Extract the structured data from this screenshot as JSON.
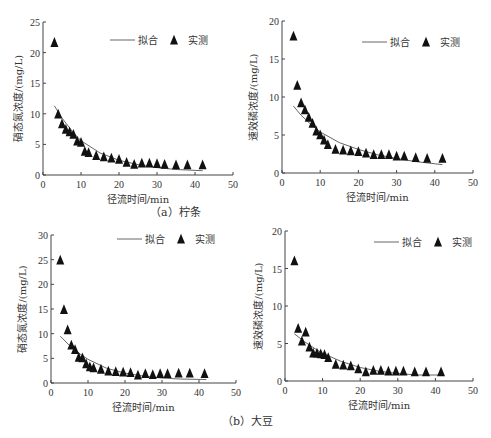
{
  "captions": {
    "a": "（a）柠条",
    "b": "（b）大豆"
  },
  "legend": {
    "fit": "拟合",
    "measured": "实测"
  },
  "colors": {
    "axis": "#444444",
    "marker": "#111111",
    "fit_line": "#555555"
  },
  "chart_data": [
    {
      "id": "a-left",
      "type": "scatter",
      "panel": "(a) 柠条",
      "title": "",
      "xlabel": "径流时间/min",
      "ylabel": "硝态氮浓度/(mg/L)",
      "xlim": [
        0,
        50
      ],
      "ylim": [
        0,
        25
      ],
      "xticks": [
        0,
        10,
        20,
        30,
        40,
        50
      ],
      "yticks": [
        0,
        5,
        10,
        15,
        20,
        25
      ],
      "legend_position": "top-right",
      "grid": false,
      "series": [
        {
          "name": "实测",
          "style": "triangle-marker",
          "x": [
            3,
            4,
            5,
            6,
            7,
            8,
            9,
            10,
            11,
            12,
            14,
            16,
            18,
            20,
            22,
            24,
            26,
            28,
            30,
            32,
            35,
            38,
            42
          ],
          "y": [
            21.5,
            9.8,
            8.2,
            7.3,
            6.9,
            6.5,
            5.4,
            5.2,
            3.7,
            3.5,
            3.0,
            2.8,
            2.6,
            2.4,
            1.9,
            1.6,
            1.8,
            1.8,
            1.7,
            1.6,
            1.5,
            1.5,
            1.5
          ]
        },
        {
          "name": "拟合",
          "style": "line",
          "x": [
            3,
            5,
            8,
            10,
            15,
            20,
            25,
            30,
            35,
            42
          ],
          "y": [
            11.3,
            9.3,
            6.9,
            5.6,
            3.6,
            2.4,
            1.7,
            1.2,
            0.9,
            0.7
          ]
        }
      ]
    },
    {
      "id": "a-right",
      "type": "scatter",
      "panel": "(a) 柠条",
      "title": "",
      "xlabel": "径流时间/min",
      "ylabel": "速效磷浓度/(mg/L)",
      "xlim": [
        0,
        50
      ],
      "ylim": [
        0,
        20
      ],
      "xticks": [
        0,
        10,
        20,
        30,
        40,
        50
      ],
      "yticks": [
        0,
        5,
        10,
        15,
        20
      ],
      "legend_position": "top-right",
      "grid": false,
      "series": [
        {
          "name": "实测",
          "style": "triangle-marker",
          "x": [
            3,
            4,
            5,
            6,
            7,
            8,
            9,
            10,
            11,
            12,
            14,
            16,
            18,
            20,
            22,
            24,
            26,
            28,
            30,
            32,
            35,
            38,
            42
          ],
          "y": [
            17.9,
            11.4,
            9.1,
            8.2,
            7.2,
            6.4,
            5.4,
            4.9,
            4.2,
            3.6,
            3.0,
            2.9,
            2.8,
            2.7,
            2.5,
            2.3,
            2.3,
            2.3,
            2.1,
            2.1,
            1.9,
            1.8,
            1.8
          ]
        },
        {
          "name": "拟合",
          "style": "line",
          "x": [
            3,
            5,
            8,
            10,
            15,
            20,
            25,
            30,
            35,
            42
          ],
          "y": [
            8.8,
            7.6,
            6.2,
            5.4,
            4.0,
            3.1,
            2.4,
            1.9,
            1.5,
            1.1
          ]
        }
      ]
    },
    {
      "id": "b-left",
      "type": "scatter",
      "panel": "(b) 大豆",
      "title": "",
      "xlabel": "径流时间/min",
      "ylabel": "硝态氮浓度/(mg/L)",
      "xlim": [
        0,
        50
      ],
      "ylim": [
        0,
        30
      ],
      "xticks": [
        0,
        10,
        20,
        30,
        40,
        50
      ],
      "yticks": [
        0,
        5,
        10,
        15,
        20,
        25,
        30
      ],
      "legend_position": "top-right",
      "grid": false,
      "series": [
        {
          "name": "实测",
          "style": "triangle-marker",
          "x": [
            2.5,
            3.5,
            4.5,
            5.5,
            6.5,
            7.5,
            8.5,
            9.5,
            10.5,
            11.5,
            13.5,
            15.5,
            17.5,
            19.5,
            21.5,
            23.5,
            25.5,
            27.5,
            29.5,
            31.5,
            34.5,
            37.5,
            41.5
          ],
          "y": [
            24.7,
            14.7,
            10.6,
            7.5,
            6.6,
            5.0,
            4.9,
            3.7,
            3.1,
            2.9,
            2.6,
            2.2,
            2.1,
            2.0,
            1.9,
            1.4,
            1.7,
            1.5,
            1.7,
            1.7,
            1.8,
            1.8,
            1.7
          ]
        },
        {
          "name": "拟合",
          "style": "line",
          "x": [
            2.5,
            5,
            8,
            10,
            15,
            20,
            25,
            30,
            35,
            42
          ],
          "y": [
            9.5,
            7.6,
            5.8,
            4.8,
            3.0,
            2.0,
            1.4,
            1.0,
            0.8,
            0.7
          ]
        }
      ]
    },
    {
      "id": "b-right",
      "type": "scatter",
      "panel": "(b) 大豆",
      "title": "",
      "xlabel": "径流时间/min",
      "ylabel": "速效磷浓度/(mg/L)",
      "xlim": [
        0,
        50
      ],
      "ylim": [
        0,
        20
      ],
      "xticks": [
        0,
        10,
        20,
        30,
        40,
        50
      ],
      "yticks": [
        0,
        5,
        10,
        15,
        20
      ],
      "legend_position": "top-right",
      "grid": false,
      "series": [
        {
          "name": "实测",
          "style": "triangle-marker",
          "x": [
            2.5,
            3.5,
            4.5,
            5.5,
            6.5,
            7.5,
            8.5,
            9.5,
            10.5,
            11.5,
            13.5,
            15.5,
            17.5,
            19.5,
            21.5,
            23.5,
            25.5,
            27.5,
            29.5,
            31.5,
            34.5,
            37.5,
            41.5
          ],
          "y": [
            15.9,
            6.9,
            5.2,
            6.4,
            4.4,
            3.6,
            3.6,
            3.5,
            3.4,
            3.0,
            2.1,
            2.0,
            1.9,
            1.5,
            1.1,
            1.3,
            1.3,
            1.2,
            1.2,
            1.2,
            1.1,
            1.1,
            1.1
          ]
        },
        {
          "name": "拟合",
          "style": "line",
          "x": [
            2.5,
            5,
            8,
            10,
            15,
            20,
            25,
            30,
            35,
            41
          ],
          "y": [
            6.3,
            5.3,
            4.3,
            3.7,
            2.6,
            1.8,
            1.3,
            1.0,
            0.8,
            0.8
          ]
        }
      ]
    }
  ]
}
